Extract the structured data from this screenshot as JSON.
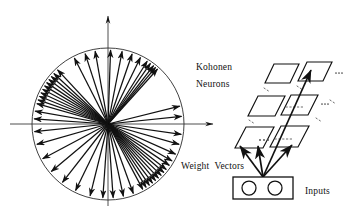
{
  "figure": {
    "background_color": "#ffffff",
    "stroke_color": "#111111",
    "width": 348,
    "height": 220
  },
  "labels": {
    "kohonen": "Kohonen",
    "neurons": "Neurons",
    "weight_vectors": "Weight  Vectors",
    "inputs": "Inputs"
  },
  "left_panel": {
    "name": "weight-vector-circle",
    "center": [
      108,
      124
    ],
    "radius": 76,
    "axes": {
      "x_axis": {
        "from": [
          10,
          124
        ],
        "to": [
          216,
          124
        ],
        "arrow": "right"
      },
      "y_axis": {
        "from": [
          108,
          206
        ],
        "to": [
          108,
          13
        ],
        "arrow": "up"
      }
    },
    "vector_angles_deg": [
      88,
      79,
      71,
      64,
      58,
      55,
      52,
      50,
      48,
      133,
      137,
      140,
      143,
      146,
      149,
      152,
      155,
      158,
      161,
      164,
      117,
      108,
      100,
      14,
      6,
      176,
      -8,
      -16,
      -24,
      -30,
      -34,
      -38,
      -41,
      -44,
      -47,
      -50,
      -53,
      -56,
      -59,
      -62,
      -70,
      -78,
      -86,
      -94,
      -104,
      -116,
      -128,
      -140,
      -152,
      -164,
      170,
      186
    ],
    "vector_count": 52
  },
  "right_panel": {
    "name": "kohonen-neuron-lattice",
    "rows": 3,
    "cols": 2,
    "cell_shape": "parallelogram",
    "continuation_dots": "...",
    "inputs_box": {
      "x": 233,
      "y": 177,
      "width": 60,
      "height": 22,
      "node_count": 2
    },
    "connection_arrows": 4
  },
  "chart_data": {
    "type": "diagram",
    "elements": [
      "weight vector circle",
      "kohonen neuron grid",
      "input layer"
    ]
  }
}
